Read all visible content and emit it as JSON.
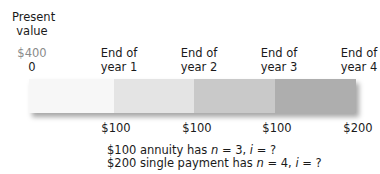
{
  "header": {
    "present_value_label_line1": "Present",
    "present_value_label_line2": "value"
  },
  "timeline": {
    "points": [
      {
        "amount": "$400",
        "label": "0"
      },
      {
        "line1": "End of",
        "line2": "year 1"
      },
      {
        "line1": "End of",
        "line2": "year 2"
      },
      {
        "line1": "End of",
        "line2": "year 3"
      },
      {
        "line1": "End of",
        "line2": "year 4"
      }
    ],
    "segments": [
      {
        "color": "#f7f7f7"
      },
      {
        "color": "#e4e4e4"
      },
      {
        "color": "#c9c9c9"
      },
      {
        "color": "#aeaeae"
      }
    ],
    "cash_flows": [
      "$100",
      "$100",
      "$100",
      "$200"
    ]
  },
  "notes": {
    "line1_prefix": "$100 annuity has ",
    "line1_n": "n",
    "line1_mid": " = 3, ",
    "line1_i": "i",
    "line1_suffix": " = ?",
    "line2_prefix": "$200 single payment has ",
    "line2_n": "n",
    "line2_mid": " = 4, ",
    "line2_i": "i",
    "line2_suffix": " = ?"
  }
}
